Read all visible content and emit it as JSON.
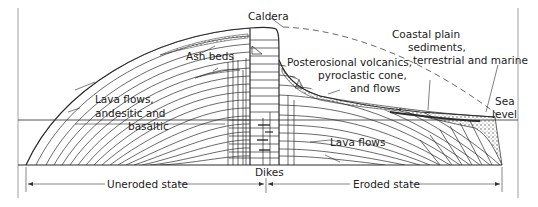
{
  "diagram": {
    "type": "geologic cross-section of a volcano",
    "labels": {
      "caldera": "Caldera",
      "ash_beds": "Ash beds",
      "lava_flows_1": "Lava flows,",
      "lava_flows_2": "andesitic and",
      "lava_flows_3": "basaltic",
      "posterosional_1": "Posterosional volcanics,",
      "posterosional_2": "pyroclastic cone,",
      "posterosional_3": "and flows",
      "coastal_1": "Coastal plain",
      "coastal_2": "sediments,",
      "coastal_3": "terrestrial and marine",
      "sea_1": "Sea",
      "sea_2": "level",
      "lava_flows_right": "Lava flows",
      "dikes": "Dikes",
      "uneroded": "Uneroded state",
      "eroded": "Eroded state"
    },
    "colors": {
      "line": "#2a2a2a",
      "frame": "#888888",
      "background": "#ffffff"
    }
  }
}
